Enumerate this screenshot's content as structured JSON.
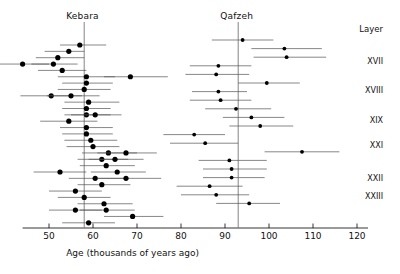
{
  "figure": {
    "width": 400,
    "height": 274,
    "background": "#ffffff",
    "ink": "#000000",
    "error_bar_color": "#555555"
  },
  "panels": {
    "left_title": "Kebara",
    "right_title": "Qafzeh",
    "layer_header": "Layer"
  },
  "layers": [
    {
      "label": "XVII",
      "y": 61
    },
    {
      "label": "XVIII",
      "y": 90
    },
    {
      "label": "XIX",
      "y": 120
    },
    {
      "label": "XXI",
      "y": 145
    },
    {
      "label": "XXII",
      "y": 178
    },
    {
      "label": "XXIII",
      "y": 196
    }
  ],
  "chart_data": {
    "type": "scatter",
    "title": "",
    "xlabel": "Age (thousands of years ago)",
    "ylabel": "Layer",
    "xlim": [
      44,
      122.5
    ],
    "ylim": [
      0,
      1
    ],
    "grid": false,
    "legend": "none",
    "xticks": [
      50,
      60,
      70,
      80,
      90,
      100,
      110,
      120
    ],
    "xtick_labels": [
      "50",
      "60",
      "70",
      "80",
      "90",
      "100",
      "110",
      "120"
    ],
    "annotations": [
      {
        "text": "Kebara",
        "x": 58,
        "note": "left panel site name above its mean line"
      },
      {
        "text": "Qafzeh",
        "x": 93,
        "note": "right panel site name above its mean line"
      }
    ],
    "reference_lines": [
      {
        "name": "kebara-mean",
        "x": 58,
        "orientation": "vertical"
      },
      {
        "name": "qafzeh-mean",
        "x": 93,
        "orientation": "vertical"
      }
    ],
    "series": [
      {
        "name": "Kebara",
        "marker": "filled-circle",
        "points": [
          {
            "x": 57.0,
            "xerr_low": 52.5,
            "xerr_high": 63.0,
            "row": 1
          },
          {
            "x": 54.5,
            "xerr_low": 49.0,
            "xerr_high": 58.0,
            "row": 2
          },
          {
            "x": 52.0,
            "xerr_low": 47.0,
            "xerr_high": 58.0,
            "row": 3
          },
          {
            "x": 44.0,
            "xerr_low": 38.0,
            "xerr_high": 50.0,
            "row": 4
          },
          {
            "x": 51.0,
            "xerr_low": 46.0,
            "xerr_high": 56.5,
            "row": 4
          },
          {
            "x": 53.0,
            "xerr_low": 47.5,
            "xerr_high": 58.5,
            "row": 5
          },
          {
            "x": 58.5,
            "xerr_low": 52.0,
            "xerr_high": 65.0,
            "row": 6
          },
          {
            "x": 68.5,
            "xerr_low": 62.5,
            "xerr_high": 77.0,
            "row": 6
          },
          {
            "x": 58.5,
            "xerr_low": 53.0,
            "xerr_high": 64.5,
            "row": 7
          },
          {
            "x": 58.0,
            "xerr_low": 52.0,
            "xerr_high": 64.0,
            "row": 8
          },
          {
            "x": 50.5,
            "xerr_low": 43.5,
            "xerr_high": 57.5,
            "row": 9
          },
          {
            "x": 55.0,
            "xerr_low": 49.5,
            "xerr_high": 61.5,
            "row": 9
          },
          {
            "x": 59.0,
            "xerr_low": 53.5,
            "xerr_high": 66.0,
            "row": 10
          },
          {
            "x": 58.5,
            "xerr_low": 53.0,
            "xerr_high": 64.0,
            "row": 11
          },
          {
            "x": 58.5,
            "xerr_low": 53.5,
            "xerr_high": 64.0,
            "row": 12
          },
          {
            "x": 60.5,
            "xerr_low": 55.0,
            "xerr_high": 66.5,
            "row": 12
          },
          {
            "x": 54.5,
            "xerr_low": 48.0,
            "xerr_high": 61.0,
            "row": 13
          },
          {
            "x": 58.5,
            "xerr_low": 52.5,
            "xerr_high": 64.5,
            "row": 14
          },
          {
            "x": 58.5,
            "xerr_low": 53.0,
            "xerr_high": 64.5,
            "row": 15
          },
          {
            "x": 59.5,
            "xerr_low": 53.5,
            "xerr_high": 65.5,
            "row": 16
          },
          {
            "x": 60.0,
            "xerr_low": 54.0,
            "xerr_high": 66.0,
            "row": 17
          },
          {
            "x": 63.5,
            "xerr_low": 57.5,
            "xerr_high": 70.0,
            "row": 18
          },
          {
            "x": 67.5,
            "xerr_low": 61.0,
            "xerr_high": 74.5,
            "row": 18
          },
          {
            "x": 62.0,
            "xerr_low": 56.5,
            "xerr_high": 68.0,
            "row": 19
          },
          {
            "x": 65.0,
            "xerr_low": 59.0,
            "xerr_high": 71.5,
            "row": 19
          },
          {
            "x": 63.0,
            "xerr_low": 57.0,
            "xerr_high": 69.5,
            "row": 20
          },
          {
            "x": 52.5,
            "xerr_low": 46.5,
            "xerr_high": 58.5,
            "row": 21
          },
          {
            "x": 65.5,
            "xerr_low": 59.5,
            "xerr_high": 72.0,
            "row": 21
          },
          {
            "x": 60.5,
            "xerr_low": 54.5,
            "xerr_high": 67.0,
            "row": 22
          },
          {
            "x": 67.5,
            "xerr_low": 61.0,
            "xerr_high": 75.5,
            "row": 22
          },
          {
            "x": 62.0,
            "xerr_low": 56.5,
            "xerr_high": 68.5,
            "row": 23
          },
          {
            "x": 56.0,
            "xerr_low": 50.0,
            "xerr_high": 62.0,
            "row": 24
          },
          {
            "x": 58.0,
            "xerr_low": 52.0,
            "xerr_high": 64.0,
            "row": 25
          },
          {
            "x": 62.5,
            "xerr_low": 56.5,
            "xerr_high": 69.0,
            "row": 26
          },
          {
            "x": 63.0,
            "xerr_low": 57.0,
            "xerr_high": 69.5,
            "row": 27
          },
          {
            "x": 56.0,
            "xerr_low": 50.0,
            "xerr_high": 62.0,
            "row": 27
          },
          {
            "x": 69.0,
            "xerr_low": 62.5,
            "xerr_high": 76.0,
            "row": 28
          },
          {
            "x": 59.0,
            "xerr_low": 53.0,
            "xerr_high": 65.0,
            "row": 29
          }
        ]
      },
      {
        "name": "Qafzeh",
        "marker": "filled-circle",
        "points": [
          {
            "x": 94.0,
            "xerr_low": 87.0,
            "xerr_high": 101.0,
            "row": 1
          },
          {
            "x": 103.5,
            "xerr_low": 96.0,
            "xerr_high": 112.0,
            "row": 2
          },
          {
            "x": 104.0,
            "xerr_low": 96.5,
            "xerr_high": 113.0,
            "row": 3
          },
          {
            "x": 88.5,
            "xerr_low": 82.0,
            "xerr_high": 96.0,
            "row": 4
          },
          {
            "x": 88.0,
            "xerr_low": 81.0,
            "xerr_high": 95.5,
            "row": 5
          },
          {
            "x": 99.5,
            "xerr_low": 93.0,
            "xerr_high": 107.0,
            "row": 6
          },
          {
            "x": 88.5,
            "xerr_low": 82.5,
            "xerr_high": 95.0,
            "row": 7
          },
          {
            "x": 89.0,
            "xerr_low": 82.0,
            "xerr_high": 96.0,
            "row": 8
          },
          {
            "x": 92.5,
            "xerr_low": 85.5,
            "xerr_high": 100.5,
            "row": 9
          },
          {
            "x": 96.0,
            "xerr_low": 89.5,
            "xerr_high": 103.5,
            "row": 10
          },
          {
            "x": 98.0,
            "xerr_low": 91.0,
            "xerr_high": 105.5,
            "row": 11
          },
          {
            "x": 83.0,
            "xerr_low": 76.0,
            "xerr_high": 90.0,
            "row": 12
          },
          {
            "x": 85.5,
            "xerr_low": 77.5,
            "xerr_high": 93.0,
            "row": 13
          },
          {
            "x": 107.5,
            "xerr_low": 99.0,
            "xerr_high": 116.0,
            "row": 14
          },
          {
            "x": 91.0,
            "xerr_low": 84.0,
            "xerr_high": 99.5,
            "row": 15
          },
          {
            "x": 91.5,
            "xerr_low": 85.0,
            "xerr_high": 99.5,
            "row": 16
          },
          {
            "x": 91.5,
            "xerr_low": 85.0,
            "xerr_high": 99.0,
            "row": 17
          },
          {
            "x": 86.5,
            "xerr_low": 79.0,
            "xerr_high": 94.0,
            "row": 18
          },
          {
            "x": 88.0,
            "xerr_low": 80.0,
            "xerr_high": 95.5,
            "row": 19
          },
          {
            "x": 95.5,
            "xerr_low": 88.0,
            "xerr_high": 102.5,
            "row": 20
          }
        ]
      }
    ]
  }
}
